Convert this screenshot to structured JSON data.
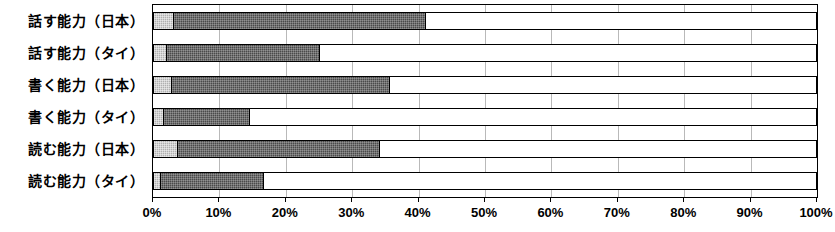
{
  "chart_data": {
    "type": "bar",
    "orientation": "horizontal",
    "stacked": true,
    "stacked_percent": true,
    "title": "",
    "subtitle": "",
    "xlabel": "",
    "ylabel": "",
    "xlim": [
      0,
      100
    ],
    "grid": true,
    "legend": null,
    "legend_position": "none",
    "categories": [
      "話す能力（日本）",
      "話す能力（タイ）",
      "書く能力（日本）",
      "書く能力（タイ）",
      "読む能力（日本）",
      "読む能力（タイ）"
    ],
    "series": [
      {
        "name": "segment-1",
        "color": "#b0b0b0",
        "values": [
          3,
          2,
          2.7,
          1.5,
          3.6,
          1
        ]
      },
      {
        "name": "segment-2",
        "color": "#4a4a4a",
        "values": [
          38,
          23,
          32.8,
          13,
          30.4,
          15.5
        ]
      },
      {
        "name": "segment-3",
        "color": "#ffffff",
        "values": [
          59,
          75,
          64.5,
          85.5,
          66,
          83.5
        ]
      }
    ],
    "cumulative_totals": [
      41,
      25,
      35.5,
      14.5,
      34,
      16.5
    ],
    "tick_values": [
      0,
      10,
      20,
      30,
      40,
      50,
      60,
      70,
      80,
      90,
      100
    ],
    "tick_labels": [
      "0%",
      "10%",
      "20%",
      "30%",
      "40%",
      "50%",
      "60%",
      "70%",
      "80%",
      "90%",
      "100%"
    ]
  }
}
